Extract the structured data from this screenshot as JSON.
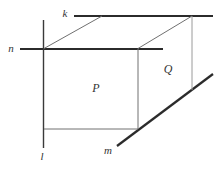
{
  "figure": {
    "width": 221,
    "height": 172,
    "background_color": "#ffffff",
    "colors": {
      "thick_line": "#2b2b2b",
      "medium_line": "#3a3a3a",
      "thin_edge": "#707070",
      "light_edge": "#9a9a9a",
      "label": "#333333"
    },
    "stroke_widths": {
      "thick": 2.2,
      "medium": 1.4,
      "thin": 1,
      "light": 1
    },
    "lines": [
      {
        "name": "line-k",
        "role": "line k along back-top edge",
        "x1": 74,
        "y1": 16,
        "x2": 213,
        "y2": 16,
        "weight": "thick"
      },
      {
        "name": "line-n",
        "role": "line n along front-top edge",
        "x1": 20,
        "y1": 49,
        "x2": 163,
        "y2": 49,
        "weight": "thick"
      },
      {
        "name": "line-m",
        "role": "line m along bottom-right edge",
        "x1": 117,
        "y1": 146,
        "x2": 213,
        "y2": 74,
        "weight": "thick"
      },
      {
        "name": "line-l",
        "role": "line l along front-left edge",
        "x1": 43.5,
        "y1": 20,
        "x2": 43.5,
        "y2": 148,
        "weight": "medium"
      },
      {
        "name": "edge-top-left-diagonal",
        "role": "box top face left depth edge",
        "x1": 44,
        "y1": 48.5,
        "x2": 102,
        "y2": 16,
        "weight": "thin"
      },
      {
        "name": "edge-top-right-diagonal",
        "role": "box top face right depth edge",
        "x1": 138,
        "y1": 48.5,
        "x2": 192,
        "y2": 16,
        "weight": "thin"
      },
      {
        "name": "edge-front-right-vertical",
        "role": "box front-right vertical edge",
        "x1": 138,
        "y1": 48.5,
        "x2": 138,
        "y2": 129,
        "weight": "thin"
      },
      {
        "name": "edge-front-bottom",
        "role": "box front bottom edge",
        "x1": 44,
        "y1": 129,
        "x2": 138,
        "y2": 129,
        "weight": "thin"
      },
      {
        "name": "edge-back-right-vertical",
        "role": "box back-right vertical edge",
        "x1": 192,
        "y1": 16,
        "x2": 192,
        "y2": 90,
        "weight": "light"
      }
    ],
    "labels": [
      {
        "name": "label-line-k",
        "text": "k",
        "x": 65,
        "y": 13,
        "font_size": 11
      },
      {
        "name": "label-line-n",
        "text": "n",
        "x": 11,
        "y": 48,
        "font_size": 11
      },
      {
        "name": "label-line-l",
        "text": "l",
        "x": 42,
        "y": 156,
        "font_size": 11
      },
      {
        "name": "label-line-m",
        "text": "m",
        "x": 108,
        "y": 150,
        "font_size": 11
      },
      {
        "name": "label-plane-P",
        "text": "P",
        "x": 96,
        "y": 88,
        "font_size": 12
      },
      {
        "name": "label-plane-Q",
        "text": "Q",
        "x": 168,
        "y": 69,
        "font_size": 12
      }
    ]
  }
}
